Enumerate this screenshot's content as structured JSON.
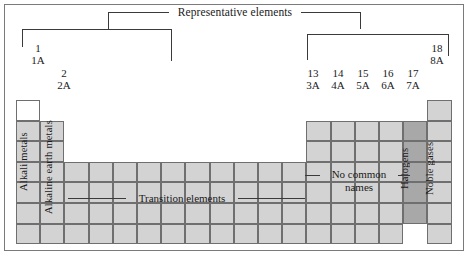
{
  "figure": {
    "title": "Representative elements"
  },
  "groups": [
    {
      "number": "1",
      "roman": "1A"
    },
    {
      "number": "2",
      "roman": "2A"
    },
    {
      "number": "13",
      "roman": "3A"
    },
    {
      "number": "14",
      "roman": "4A"
    },
    {
      "number": "15",
      "roman": "5A"
    },
    {
      "number": "16",
      "roman": "6A"
    },
    {
      "number": "17",
      "roman": "7A"
    },
    {
      "number": "18",
      "roman": "8A"
    }
  ],
  "labels": {
    "alkali_metals": "Alkali metals",
    "alkaline_earth_metals": "Alkaline earth metals",
    "transition_elements": "Transition elements",
    "no_common_names_line1": "No common",
    "no_common_names_line2": "names",
    "halogens": "Halogens",
    "noble_gases": "Noble gases"
  },
  "colors": {
    "cell_light": "#d3d3d3",
    "cell_dark": "#a8a8a8",
    "cell_empty": "#ffffff",
    "border": "#6f6f6f",
    "frame": "#7a7a7a",
    "line": "#3a3a3a",
    "text": "#1a1a1a"
  },
  "chart_data": {
    "type": "table",
    "title": "Representative elements",
    "columns": 18,
    "rows": 7,
    "column_headers": [
      {
        "column": 1,
        "number": "1",
        "roman": "1A"
      },
      {
        "column": 2,
        "number": "2",
        "roman": "2A"
      },
      {
        "column": 13,
        "number": "13",
        "roman": "3A"
      },
      {
        "column": 14,
        "number": "14",
        "roman": "4A"
      },
      {
        "column": 15,
        "number": "15",
        "roman": "5A"
      },
      {
        "column": 16,
        "number": "16",
        "roman": "6A"
      },
      {
        "column": 17,
        "number": "17",
        "roman": "7A"
      },
      {
        "column": 18,
        "number": "18",
        "roman": "8A"
      }
    ],
    "brackets": [
      {
        "label": "Representative elements",
        "spans": [
          [
            1,
            2
          ],
          [
            13,
            18
          ]
        ]
      }
    ],
    "region_labels": [
      {
        "label": "Alkali metals",
        "columns": [
          1
        ],
        "orientation": "vertical"
      },
      {
        "label": "Alkaline earth metals",
        "columns": [
          2
        ],
        "orientation": "vertical"
      },
      {
        "label": "Transition elements",
        "columns": [
          3,
          12
        ],
        "orientation": "horizontal"
      },
      {
        "label": "No common names",
        "columns": [
          13,
          16
        ],
        "orientation": "horizontal"
      },
      {
        "label": "Halogens",
        "columns": [
          17
        ],
        "orientation": "vertical"
      },
      {
        "label": "Noble gases",
        "columns": [
          18
        ],
        "orientation": "vertical"
      }
    ],
    "cells": [
      [
        1,
        1,
        "white"
      ],
      [
        1,
        18,
        "light"
      ],
      [
        2,
        1,
        "light"
      ],
      [
        2,
        2,
        "light"
      ],
      [
        2,
        13,
        "light"
      ],
      [
        2,
        14,
        "light"
      ],
      [
        2,
        15,
        "light"
      ],
      [
        2,
        16,
        "light"
      ],
      [
        2,
        17,
        "dark"
      ],
      [
        2,
        18,
        "light"
      ],
      [
        3,
        1,
        "light"
      ],
      [
        3,
        2,
        "light"
      ],
      [
        3,
        13,
        "light"
      ],
      [
        3,
        14,
        "light"
      ],
      [
        3,
        15,
        "light"
      ],
      [
        3,
        16,
        "light"
      ],
      [
        3,
        17,
        "dark"
      ],
      [
        3,
        18,
        "light"
      ],
      [
        4,
        1,
        "light"
      ],
      [
        4,
        2,
        "light"
      ],
      [
        4,
        3,
        "light"
      ],
      [
        4,
        4,
        "light"
      ],
      [
        4,
        5,
        "light"
      ],
      [
        4,
        6,
        "light"
      ],
      [
        4,
        7,
        "light"
      ],
      [
        4,
        8,
        "light"
      ],
      [
        4,
        9,
        "light"
      ],
      [
        4,
        10,
        "light"
      ],
      [
        4,
        11,
        "light"
      ],
      [
        4,
        12,
        "light"
      ],
      [
        4,
        13,
        "light"
      ],
      [
        4,
        14,
        "light"
      ],
      [
        4,
        15,
        "light"
      ],
      [
        4,
        16,
        "light"
      ],
      [
        4,
        17,
        "dark"
      ],
      [
        4,
        18,
        "light"
      ],
      [
        5,
        1,
        "light"
      ],
      [
        5,
        2,
        "light"
      ],
      [
        5,
        3,
        "light"
      ],
      [
        5,
        4,
        "light"
      ],
      [
        5,
        5,
        "light"
      ],
      [
        5,
        6,
        "light"
      ],
      [
        5,
        7,
        "light"
      ],
      [
        5,
        8,
        "light"
      ],
      [
        5,
        9,
        "light"
      ],
      [
        5,
        10,
        "light"
      ],
      [
        5,
        11,
        "light"
      ],
      [
        5,
        12,
        "light"
      ],
      [
        5,
        13,
        "light"
      ],
      [
        5,
        14,
        "light"
      ],
      [
        5,
        15,
        "light"
      ],
      [
        5,
        16,
        "light"
      ],
      [
        5,
        17,
        "dark"
      ],
      [
        5,
        18,
        "light"
      ],
      [
        6,
        1,
        "light"
      ],
      [
        6,
        2,
        "light"
      ],
      [
        6,
        3,
        "light"
      ],
      [
        6,
        4,
        "light"
      ],
      [
        6,
        5,
        "light"
      ],
      [
        6,
        6,
        "light"
      ],
      [
        6,
        7,
        "light"
      ],
      [
        6,
        8,
        "light"
      ],
      [
        6,
        9,
        "light"
      ],
      [
        6,
        10,
        "light"
      ],
      [
        6,
        11,
        "light"
      ],
      [
        6,
        12,
        "light"
      ],
      [
        6,
        13,
        "light"
      ],
      [
        6,
        14,
        "light"
      ],
      [
        6,
        15,
        "light"
      ],
      [
        6,
        16,
        "light"
      ],
      [
        6,
        17,
        "dark"
      ],
      [
        6,
        18,
        "light"
      ],
      [
        7,
        1,
        "light"
      ],
      [
        7,
        2,
        "light"
      ],
      [
        7,
        3,
        "light"
      ],
      [
        7,
        4,
        "light"
      ],
      [
        7,
        5,
        "light"
      ],
      [
        7,
        6,
        "light"
      ],
      [
        7,
        7,
        "light"
      ],
      [
        7,
        8,
        "light"
      ],
      [
        7,
        9,
        "light"
      ],
      [
        7,
        10,
        "light"
      ],
      [
        7,
        11,
        "light"
      ],
      [
        7,
        12,
        "light"
      ],
      [
        7,
        13,
        "light"
      ],
      [
        7,
        14,
        "light"
      ],
      [
        7,
        15,
        "light"
      ],
      [
        7,
        16,
        "light"
      ],
      [
        7,
        18,
        "light"
      ]
    ]
  }
}
